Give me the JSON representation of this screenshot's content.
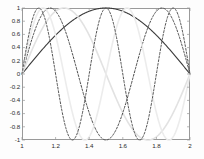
{
  "figure": {
    "name": "sine-harmonics-plot",
    "background": "#ffffff",
    "axes_color": "#9a9a9a",
    "tick_text_color": "#2b2b2b"
  },
  "chart_data": {
    "type": "line",
    "title": "",
    "xlabel": "",
    "ylabel": "",
    "xlim": [
      1,
      2
    ],
    "ylim": [
      -1,
      1
    ],
    "grid": false,
    "legend": "none",
    "xticks": [
      "1",
      "1.2",
      "1.4",
      "1.6",
      "1.8",
      "2"
    ],
    "xtick_values": [
      1,
      1.2,
      1.4,
      1.6,
      1.8,
      2
    ],
    "yticks": [
      "1",
      "0.8",
      "0.6",
      "0.4",
      "0.2",
      "0",
      "-0.2",
      "-0.4",
      "-0.6",
      "-0.8",
      "-1"
    ],
    "ytick_values": [
      1,
      0.8,
      0.6,
      0.4,
      0.2,
      0,
      -0.2,
      -0.4,
      -0.6,
      -0.8,
      -1
    ],
    "series": [
      {
        "name": "mode-1",
        "formula": "sin(1*pi*(x-1))",
        "harmonic": 1,
        "color": "#3a3a3a",
        "style": "solid",
        "width": 1.1,
        "x": [
          1,
          1.05,
          1.1,
          1.15,
          1.2,
          1.25,
          1.3,
          1.35,
          1.4,
          1.45,
          1.5,
          1.55,
          1.6,
          1.65,
          1.7,
          1.75,
          1.8,
          1.85,
          1.9,
          1.95,
          2
        ],
        "y": [
          0,
          0.156,
          0.309,
          0.454,
          0.588,
          0.707,
          0.809,
          0.891,
          0.951,
          0.988,
          1,
          0.988,
          0.951,
          0.891,
          0.809,
          0.707,
          0.588,
          0.454,
          0.309,
          0.156,
          0
        ]
      },
      {
        "name": "mode-2",
        "formula": "sin(2*pi*(x-1))",
        "harmonic": 2,
        "color": "#e2e2e2",
        "style": "solid",
        "width": 1.6,
        "x": [
          1,
          1.05,
          1.1,
          1.15,
          1.2,
          1.25,
          1.3,
          1.35,
          1.4,
          1.45,
          1.5,
          1.55,
          1.6,
          1.65,
          1.7,
          1.75,
          1.8,
          1.85,
          1.9,
          1.95,
          2
        ],
        "y": [
          0,
          0.309,
          0.588,
          0.809,
          0.951,
          1,
          0.951,
          0.809,
          0.588,
          0.309,
          0,
          -0.309,
          -0.588,
          -0.809,
          -0.951,
          -1,
          -0.951,
          -0.809,
          -0.588,
          -0.309,
          0
        ]
      },
      {
        "name": "mode-3",
        "formula": "sin(3*pi*(x-1))",
        "harmonic": 3,
        "color": "#4a4a4a",
        "style": "dashed",
        "width": 1.0,
        "x": [
          1,
          1.05,
          1.1,
          1.15,
          1.2,
          1.25,
          1.3,
          1.35,
          1.4,
          1.45,
          1.5,
          1.55,
          1.6,
          1.65,
          1.7,
          1.75,
          1.8,
          1.85,
          1.9,
          1.95,
          2
        ],
        "y": [
          0,
          0.454,
          0.809,
          0.988,
          0.951,
          0.707,
          0.309,
          -0.156,
          -0.588,
          -0.891,
          -1,
          -0.891,
          -0.588,
          -0.156,
          0.309,
          0.707,
          0.951,
          0.988,
          0.809,
          0.454,
          0
        ]
      },
      {
        "name": "mode-4",
        "formula": "sin(4*pi*(x-1))",
        "harmonic": 4,
        "color": "#ececec",
        "style": "solid",
        "width": 1.6,
        "x": [
          1,
          1.05,
          1.1,
          1.15,
          1.2,
          1.25,
          1.3,
          1.35,
          1.4,
          1.45,
          1.5,
          1.55,
          1.6,
          1.65,
          1.7,
          1.75,
          1.8,
          1.85,
          1.9,
          1.95,
          2
        ],
        "y": [
          0,
          0.588,
          0.951,
          0.951,
          0.588,
          0,
          -0.588,
          -0.951,
          -0.951,
          -0.588,
          0,
          0.588,
          0.951,
          0.951,
          0.588,
          0,
          -0.588,
          -0.951,
          -0.951,
          -0.588,
          0
        ]
      },
      {
        "name": "mode-5",
        "formula": "sin(5*pi*(x-1))",
        "harmonic": 5,
        "color": "#555555",
        "style": "dashed",
        "width": 1.0,
        "x": [
          1,
          1.05,
          1.1,
          1.15,
          1.2,
          1.25,
          1.3,
          1.35,
          1.4,
          1.45,
          1.5,
          1.55,
          1.6,
          1.65,
          1.7,
          1.75,
          1.8,
          1.85,
          1.9,
          1.95,
          2
        ],
        "y": [
          0,
          0.707,
          1,
          0.707,
          0,
          -0.707,
          -1,
          -0.707,
          0,
          0.707,
          1,
          0.707,
          0,
          -0.707,
          -1,
          -0.707,
          0,
          0.707,
          1,
          0.707,
          0
        ]
      }
    ]
  }
}
